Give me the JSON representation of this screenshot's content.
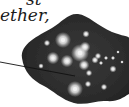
{
  "text": {
    "line1": "st",
    "line2": "ether,"
  },
  "figure": {
    "blob_color": "#2b2b2b",
    "star_color": "#f2f2f2",
    "leader_line_color": "#111111",
    "stars": [
      {
        "x": 63,
        "y": 40,
        "r": 4.5
      },
      {
        "x": 86,
        "y": 34,
        "r": 2
      },
      {
        "x": 47,
        "y": 43,
        "r": 1.8
      },
      {
        "x": 53,
        "y": 58,
        "r": 3.5
      },
      {
        "x": 67,
        "y": 61,
        "r": 3.5
      },
      {
        "x": 80,
        "y": 53,
        "r": 5
      },
      {
        "x": 85,
        "y": 47,
        "r": 3
      },
      {
        "x": 84,
        "y": 65,
        "r": 3
      },
      {
        "x": 95,
        "y": 60,
        "r": 2
      },
      {
        "x": 98,
        "y": 56,
        "r": 1.8
      },
      {
        "x": 101,
        "y": 63,
        "r": 1.2
      },
      {
        "x": 106,
        "y": 58,
        "r": 1.2
      },
      {
        "x": 113,
        "y": 58,
        "r": 1.2
      },
      {
        "x": 113,
        "y": 69,
        "r": 2
      },
      {
        "x": 89,
        "y": 73,
        "r": 1.8
      },
      {
        "x": 75,
        "y": 89,
        "r": 4.5
      },
      {
        "x": 88,
        "y": 84,
        "r": 1.8
      },
      {
        "x": 104,
        "y": 87,
        "r": 1.8
      },
      {
        "x": 41,
        "y": 66,
        "r": 1.5
      },
      {
        "x": 118,
        "y": 52,
        "r": 1
      },
      {
        "x": 122,
        "y": 62,
        "r": 1
      }
    ]
  }
}
